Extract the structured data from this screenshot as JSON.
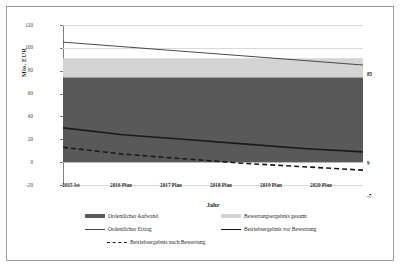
{
  "chart_data": {
    "type": "area",
    "title": "",
    "xlabel": "Jahr",
    "ylabel": "Mio. EUR",
    "ylim": [
      -20,
      120
    ],
    "yticks": [
      120,
      100,
      80,
      60,
      40,
      20,
      0,
      -20
    ],
    "grid": true,
    "legend_position": "bottom",
    "categories": [
      "2015 Ist",
      "2016 Plan",
      "2017 Plan",
      "2018 Plan",
      "2019 Plan",
      "2020 Plan"
    ],
    "series": [
      {
        "name": "Ordentlicher Aufwand",
        "render": "stacked-area",
        "color": "#595959",
        "values": [
          74,
          74,
          74,
          74,
          74,
          74
        ]
      },
      {
        "name": "Bewertungsergebnis gesamt",
        "render": "stacked-area",
        "color": "#d4d4d4",
        "values": [
          17,
          17,
          17,
          17,
          17,
          17
        ]
      },
      {
        "name": "Ordentlicher Ertrag",
        "render": "line",
        "color": "#4a4a4a",
        "values": [
          105,
          101,
          97,
          93,
          89,
          85
        ],
        "end_label": "85"
      },
      {
        "name": "Betriebsergebnis vor Bewertung",
        "render": "line-thick",
        "color": "#1a1a1a",
        "values": [
          30,
          24,
          20,
          16,
          12,
          9
        ],
        "end_label": "9"
      },
      {
        "name": "Betriebsergebnis nach Bewertung",
        "render": "line-dashed",
        "color": "#1a1a1a",
        "values": [
          13,
          7,
          3,
          -1,
          -4,
          -7
        ],
        "end_label": "-7"
      }
    ]
  },
  "axes": {
    "y_title": "Mio. EUR",
    "x_title": "Jahr",
    "y_tick_labels": [
      "120",
      "100",
      "80",
      "60",
      "40",
      "20",
      "0",
      "-20"
    ],
    "x_tick_labels": [
      "2015 Ist",
      "2016 Plan",
      "2017 Plan",
      "2018 Plan",
      "2019 Plan",
      "2020 Plan"
    ]
  },
  "end_labels": {
    "ertrag": "85",
    "vor_bewertung": "9",
    "nach_bewertung": "-7"
  },
  "legend": {
    "items": [
      {
        "label": "Ordentlicher Aufwand",
        "style": "area",
        "color": "#595959"
      },
      {
        "label": "Bewertungsergebnis gesamt",
        "style": "area",
        "color": "#d4d4d4"
      },
      {
        "label": "Ordentlicher Ertrag",
        "style": "line",
        "color": "#4a4a4a"
      },
      {
        "label": "Betriebsergebnis vor Bewertung",
        "style": "line-thick",
        "color": "#1a1a1a"
      },
      {
        "label": "Betriebsergebnis nach Bewertung",
        "style": "dashed",
        "color": "#1a1a1a"
      }
    ]
  }
}
